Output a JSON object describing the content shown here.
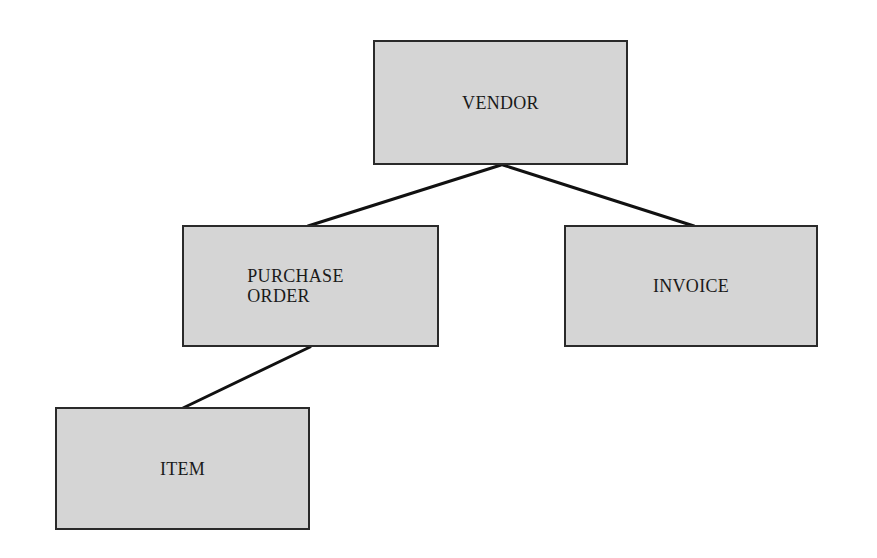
{
  "diagram": {
    "type": "hierarchy",
    "nodes": [
      {
        "id": "vendor",
        "label": "VENDOR"
      },
      {
        "id": "purchase_order",
        "label": "PURCHASE\nORDER"
      },
      {
        "id": "invoice",
        "label": "INVOICE"
      },
      {
        "id": "item",
        "label": "ITEM"
      }
    ],
    "edges": [
      {
        "from": "vendor",
        "to": "purchase_order"
      },
      {
        "from": "vendor",
        "to": "invoice"
      },
      {
        "from": "purchase_order",
        "to": "item"
      }
    ],
    "colors": {
      "box_fill": "#d5d5d5",
      "box_border": "#2a2a2a",
      "line": "#111111",
      "text": "#1a1a1a",
      "background": "#ffffff"
    }
  }
}
